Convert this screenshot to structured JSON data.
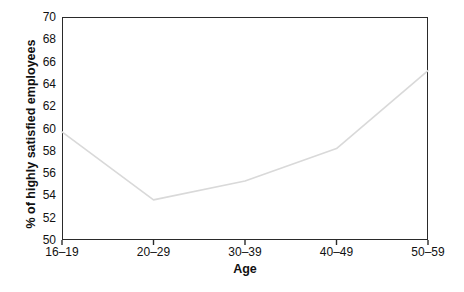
{
  "chart_data": {
    "type": "line",
    "title": "",
    "xlabel": "Age",
    "ylabel": "% of highly satisfied employees",
    "categories": [
      "16–19",
      "20–29",
      "30–39",
      "40–49",
      "50–59"
    ],
    "series": [
      {
        "name": "% of highly satisfied employees",
        "values": [
          59.7,
          53.6,
          55.3,
          58.2,
          65.2
        ],
        "color": "#d9d9d9"
      }
    ],
    "ylim": [
      50,
      70
    ],
    "yticks": [
      50,
      52,
      54,
      56,
      58,
      60,
      62,
      64,
      66,
      68,
      70
    ],
    "ytick_labels": [
      "50",
      "52",
      "54",
      "56",
      "58",
      "60",
      "62",
      "64",
      "66",
      "68",
      "70"
    ],
    "xtick_labels": [
      "16–19",
      "20–29",
      "30–39",
      "40–49",
      "50–59"
    ],
    "grid": false,
    "legend": false,
    "legend_position": "none",
    "frame": "box",
    "frame_color": "#2a2a2a",
    "background": "#ffffff"
  }
}
